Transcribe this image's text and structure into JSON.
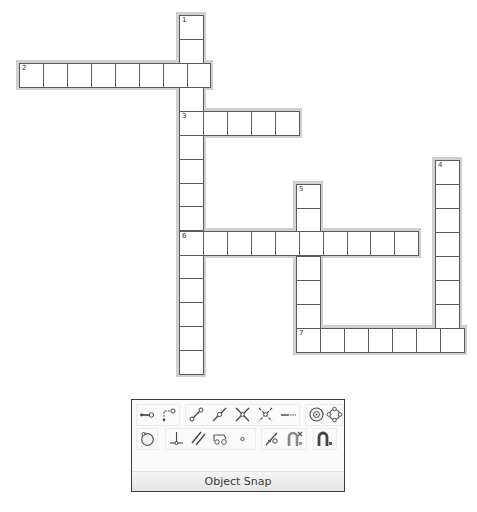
{
  "crossword": {
    "words": [
      {
        "number": "1",
        "direction": "down",
        "length": 15
      },
      {
        "number": "2",
        "direction": "across",
        "length": 8
      },
      {
        "number": "3",
        "direction": "across",
        "length": 5
      },
      {
        "number": "4",
        "direction": "down",
        "length": 8
      },
      {
        "number": "5",
        "direction": "down",
        "length": 7
      },
      {
        "number": "6",
        "direction": "across",
        "length": 10
      },
      {
        "number": "7",
        "direction": "across",
        "length": 7
      }
    ]
  },
  "toolbar": {
    "title": "Object Snap",
    "row1": [
      {
        "icon": "endpoint-snap-icon"
      },
      {
        "icon": "extension-snap-icon"
      },
      {
        "icon": "endpoint-line-snap-icon"
      },
      {
        "icon": "midpoint-snap-icon"
      },
      {
        "icon": "intersection-snap-icon"
      },
      {
        "icon": "apparent-intersection-snap-icon"
      },
      {
        "icon": "extension-dashed-snap-icon"
      },
      {
        "icon": "center-snap-icon"
      },
      {
        "icon": "quadrant-snap-icon"
      }
    ],
    "row2": [
      {
        "icon": "tangent-snap-icon"
      },
      {
        "icon": "perpendicular-snap-icon"
      },
      {
        "icon": "parallel-snap-icon"
      },
      {
        "icon": "insert-snap-icon"
      },
      {
        "icon": "node-snap-icon"
      },
      {
        "icon": "nearest-snap-icon"
      },
      {
        "icon": "none-snap-icon"
      },
      {
        "icon": "osnap-settings-icon"
      }
    ]
  }
}
